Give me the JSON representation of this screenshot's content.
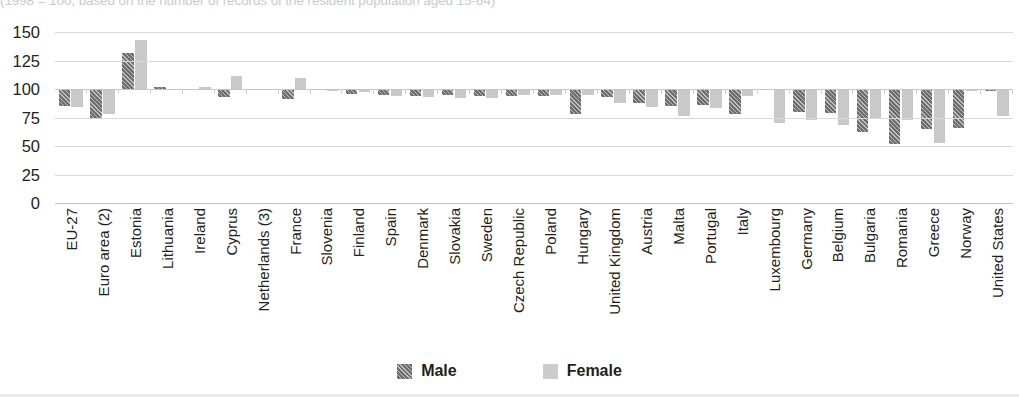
{
  "subtitle": "(1998 = 100, based on the number of records of the resident population aged 15-64)",
  "legend": {
    "items": [
      {
        "label": "Male",
        "color": "#6e6e6e",
        "pattern": "diagonal-hatch"
      },
      {
        "label": "Female",
        "color": "#c9c9c9",
        "pattern": "solid"
      }
    ]
  },
  "chart_data": {
    "type": "bar",
    "title": "",
    "subtitle": "(1998 = 100, based on the number of records of the resident population aged 15-64)",
    "xlabel": "",
    "ylabel": "",
    "ylim": [
      0,
      150
    ],
    "yticks": [
      0,
      25,
      50,
      75,
      100,
      125,
      150
    ],
    "baseline": 100,
    "grid": true,
    "legend_position": "bottom",
    "categories": [
      "EU-27",
      "Euro area (2)",
      "Estonia",
      "Lithuania",
      "Ireland",
      "Cyprus",
      "Netherlands (3)",
      "France",
      "Slovenia",
      "Finland",
      "Spain",
      "Denmark",
      "Slovakia",
      "Sweden",
      "Czech Republic",
      "Poland",
      "Hungary",
      "United Kingdom",
      "Austria",
      "Malta",
      "Portugal",
      "Italy",
      "Luxembourg",
      "Germany",
      "Belgium",
      "Bulgaria",
      "Romania",
      "Greece",
      "Norway",
      "United States"
    ],
    "series": [
      {
        "name": "Male",
        "color": "#6e6e6e",
        "values": [
          85,
          74,
          132,
          102,
          99,
          93,
          100,
          91,
          99,
          96,
          95,
          94,
          95,
          94,
          94,
          94,
          78,
          93,
          88,
          85,
          86,
          78,
          99,
          80,
          79,
          62,
          52,
          65,
          66,
          98
        ]
      },
      {
        "name": "Female",
        "color": "#c9c9c9",
        "values": [
          84,
          78,
          143,
          100,
          102,
          111,
          100,
          110,
          98,
          97,
          94,
          93,
          92,
          92,
          95,
          95,
          95,
          88,
          84,
          76,
          83,
          94,
          70,
          73,
          68,
          74,
          73,
          53,
          98,
          76
        ]
      }
    ]
  }
}
